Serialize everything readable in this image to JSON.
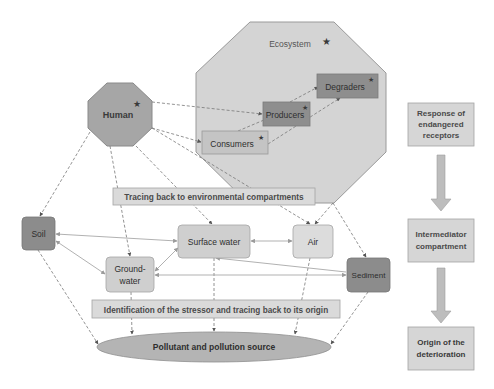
{
  "diagram": {
    "ecosystem": {
      "label": "Ecosystem",
      "star": "★",
      "fill": "#d4d4d4",
      "members": [
        {
          "id": "degraders",
          "label": "Degraders",
          "star": "★",
          "fill": "#8e8e8e"
        },
        {
          "id": "producers",
          "label": "Producers",
          "star": "★",
          "fill": "#8e8e8e"
        },
        {
          "id": "consumers",
          "label": "Consumers",
          "star": "★",
          "fill": "#c4c4c4"
        }
      ]
    },
    "human": {
      "label": "Human",
      "star": "★",
      "fill": "#a6a6a6"
    },
    "tracing_label": "Tracing back to environmental compartments",
    "identification_label": "Identification of the stressor and  tracing back to its origin",
    "compartments": [
      {
        "id": "soil",
        "label": "Soil",
        "fill": "#8c8c8c"
      },
      {
        "id": "surface_water",
        "label": "Surface water",
        "fill": "#cfcfcf"
      },
      {
        "id": "air",
        "label": "Air",
        "fill": "#dcdcdc"
      },
      {
        "id": "groundwater",
        "label_line1": "Ground-",
        "label_line2": "water",
        "fill": "#cfcfcf"
      },
      {
        "id": "sediment",
        "label": "Sediment",
        "fill": "#8c8c8c"
      }
    ],
    "source": {
      "label": "Pollutant and pollution source",
      "fill": "#b4b4b4"
    },
    "legend_flow": [
      {
        "line1": "Response of",
        "line2": "endangered",
        "line3": "receptors"
      },
      {
        "line1": "Intermediator",
        "line2": "compartment"
      },
      {
        "line1": "Origin of the",
        "line2": "deterioration"
      }
    ],
    "colors": {
      "line": "#808080",
      "box_border": "#9a9a9a",
      "text_dark": "#3a3a3a",
      "flow_fill": "#d6d6d6",
      "arrow_fill": "#bdbdbd"
    }
  }
}
